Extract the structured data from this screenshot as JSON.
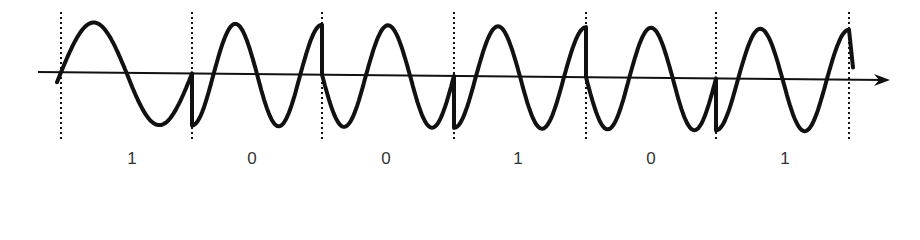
{
  "diagram": {
    "type": "psk-waveform",
    "colors": {
      "background": "#ffffff",
      "stroke": "#111111",
      "label": "#333333"
    },
    "axis": {
      "start": [
        38,
        72
      ],
      "end": [
        890,
        80
      ],
      "has_arrow": true
    },
    "amplitude": {
      "peak_y": 22,
      "trough_y": 126
    },
    "dividers_x": [
      61,
      192,
      322,
      454,
      586,
      716,
      849
    ],
    "bits": [
      {
        "value": "1",
        "label_x": 132
      },
      {
        "value": "0",
        "label_x": 252
      },
      {
        "value": "0",
        "label_x": 386
      },
      {
        "value": "1",
        "label_x": 518
      },
      {
        "value": "0",
        "label_x": 651
      },
      {
        "value": "1",
        "label_x": 785
      }
    ],
    "segments": [
      {
        "bit": "1",
        "x0": 61,
        "x1": 192,
        "start_phase": "zero-rising",
        "cycles": 1.0
      },
      {
        "bit": "0",
        "x0": 192,
        "x1": 322,
        "start_phase": "trough",
        "cycles": 1.5
      },
      {
        "bit": "0",
        "x0": 322,
        "x1": 454,
        "start_phase": "zero-falling",
        "cycles": 1.5
      },
      {
        "bit": "1",
        "x0": 454,
        "x1": 586,
        "start_phase": "trough",
        "cycles": 1.5
      },
      {
        "bit": "0",
        "x0": 586,
        "x1": 716,
        "start_phase": "zero-falling",
        "cycles": 1.5
      },
      {
        "bit": "1",
        "x0": 716,
        "x1": 849,
        "start_phase": "trough",
        "cycles": 1.5
      }
    ]
  }
}
